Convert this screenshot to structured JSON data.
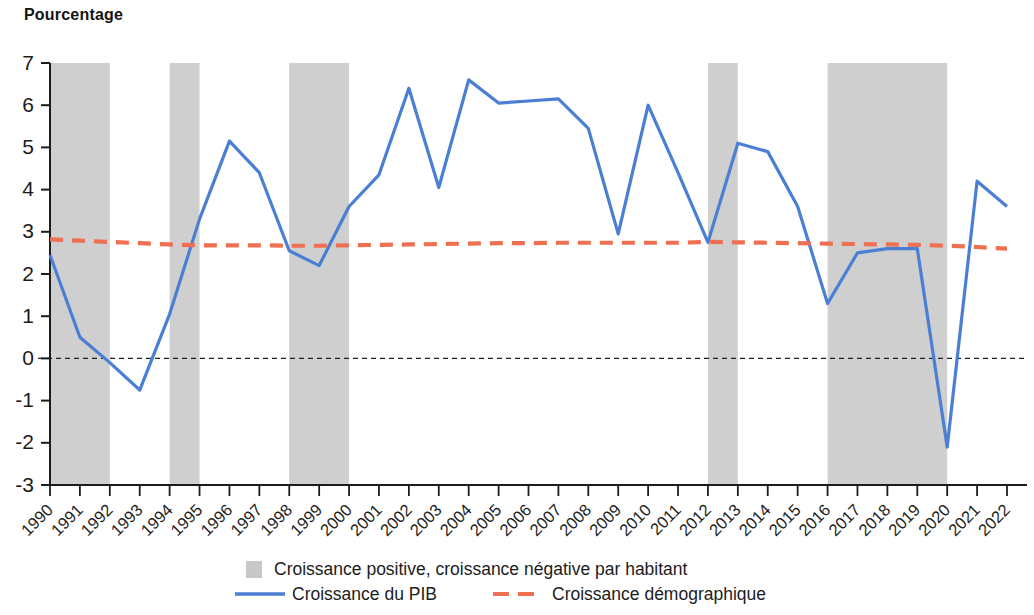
{
  "axis_title": "Pourcentage",
  "legend": {
    "band_label": "Croissance positive, croissance négative par habitant",
    "gdp_label": "Croissance du PIB",
    "demo_label": "Croissance démographique"
  },
  "colors": {
    "gdp_line": "#4a7fd4",
    "demographic_line": "#ee6f52",
    "band_fill": "#c8c8c8",
    "zero_line": "#1c1c1c",
    "axis": "#1c1c1c",
    "text": "#1c1c1c"
  },
  "chart_data": {
    "type": "line",
    "title": "",
    "subtitle": "",
    "xlabel": "",
    "ylabel": "Pourcentage",
    "ylim": [
      -3,
      7
    ],
    "yticks": [
      7,
      6,
      5,
      4,
      3,
      2,
      1,
      0,
      -1,
      -2,
      -3
    ],
    "ytick_labels": [
      "7",
      "6",
      "5",
      "4",
      "3",
      "2",
      "1",
      "0",
      "-1",
      "-2",
      "-3"
    ],
    "grid": false,
    "zero_reference_line": 0,
    "legend_position": "bottom",
    "x": [
      1990,
      1991,
      1992,
      1993,
      1994,
      1995,
      1996,
      1997,
      1998,
      1999,
      2000,
      2001,
      2002,
      2003,
      2004,
      2005,
      2006,
      2007,
      2008,
      2009,
      2010,
      2011,
      2012,
      2013,
      2014,
      2015,
      2016,
      2017,
      2018,
      2019,
      2020,
      2021,
      2022
    ],
    "xtick_labels": [
      "1990",
      "1991",
      "1992",
      "1993",
      "1994",
      "1995",
      "1996",
      "1997",
      "1998",
      "1999",
      "2000",
      "2001",
      "2002",
      "2003",
      "2004",
      "2005",
      "2006",
      "2007",
      "2008",
      "2009",
      "2010",
      "2011",
      "2012",
      "2013",
      "2014",
      "2015",
      "2016",
      "2017",
      "2018",
      "2019",
      "2020",
      "2021",
      "2022"
    ],
    "series": [
      {
        "name": "Croissance du PIB",
        "style": "solid",
        "color": "#4a7fd4",
        "values": [
          2.45,
          0.5,
          -0.1,
          -0.75,
          1.05,
          3.3,
          5.15,
          4.4,
          2.55,
          2.2,
          3.6,
          4.35,
          6.4,
          4.05,
          6.6,
          6.05,
          6.1,
          6.15,
          5.45,
          2.95,
          6.0,
          4.4,
          2.75,
          5.1,
          4.9,
          3.6,
          1.3,
          2.5,
          2.6,
          2.6,
          -2.1,
          4.2,
          3.6
        ]
      },
      {
        "name": "Croissance démographique",
        "style": "dashed",
        "color": "#ee6f52",
        "values": [
          2.82,
          2.79,
          2.76,
          2.73,
          2.7,
          2.68,
          2.68,
          2.68,
          2.67,
          2.67,
          2.68,
          2.69,
          2.7,
          2.71,
          2.72,
          2.73,
          2.73,
          2.74,
          2.74,
          2.74,
          2.74,
          2.74,
          2.76,
          2.75,
          2.74,
          2.73,
          2.72,
          2.71,
          2.7,
          2.69,
          2.67,
          2.64,
          2.6
        ]
      }
    ],
    "shaded_bands": [
      {
        "start": 1990,
        "end": 1992,
        "label": "Croissance positive, croissance négative par habitant"
      },
      {
        "start": 1994,
        "end": 1995,
        "label": "Croissance positive, croissance négative par habitant"
      },
      {
        "start": 1998,
        "end": 2000,
        "label": "Croissance positive, croissance négative par habitant"
      },
      {
        "start": 2012,
        "end": 2013,
        "label": "Croissance positive, croissance négative par habitant"
      },
      {
        "start": 2016,
        "end": 2020,
        "label": "Croissance positive, croissance négative par habitant"
      }
    ]
  }
}
